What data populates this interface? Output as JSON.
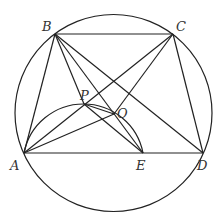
{
  "diagram": {
    "type": "geometry",
    "circle": {
      "cx": 113.5,
      "cy": 113,
      "r": 98.5
    },
    "points": {
      "A": {
        "x": 24,
        "y": 153,
        "label": "A",
        "lx": 10,
        "ly": 170
      },
      "B": {
        "x": 55,
        "y": 34,
        "label": "B",
        "lx": 42,
        "ly": 31
      },
      "C": {
        "x": 173,
        "y": 34,
        "label": "C",
        "lx": 176,
        "ly": 31
      },
      "D": {
        "x": 203,
        "y": 153,
        "label": "D",
        "lx": 197,
        "ly": 170
      },
      "E": {
        "x": 143,
        "y": 153,
        "label": "E",
        "lx": 136,
        "ly": 170
      },
      "P": {
        "x": 84,
        "y": 104,
        "label": "P",
        "lx": 80,
        "ly": 100
      },
      "O": {
        "x": 114,
        "y": 114,
        "label": "O",
        "lx": 117,
        "ly": 118
      }
    },
    "segments": [
      [
        "B",
        "C"
      ],
      [
        "A",
        "D"
      ],
      [
        "A",
        "B"
      ],
      [
        "C",
        "D"
      ],
      [
        "B",
        "D"
      ],
      [
        "A",
        "C"
      ],
      [
        "B",
        "E"
      ],
      [
        "B",
        "P"
      ],
      [
        "C",
        "O"
      ],
      [
        "A",
        "O"
      ],
      [
        "P",
        "E"
      ],
      [
        "P",
        "O"
      ]
    ],
    "arc": {
      "through": [
        "A",
        "P",
        "O",
        "E"
      ]
    },
    "colors": {
      "stroke": "#222222",
      "label": "#333333"
    }
  }
}
